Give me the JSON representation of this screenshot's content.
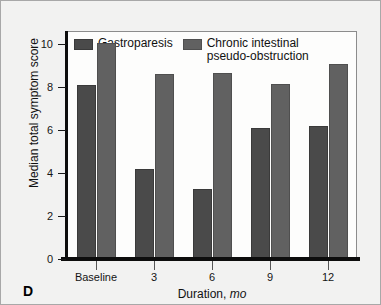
{
  "panel": {
    "label": "D"
  },
  "chart_data": {
    "type": "bar",
    "title": "",
    "xlabel": "Duration, mo",
    "xlabel_text": "Duration, ",
    "xlabel_unit": "mo",
    "ylabel": "Median total symptom score",
    "categories": [
      "Baseline",
      "3",
      "6",
      "9",
      "12"
    ],
    "yticks": [
      0,
      2,
      4,
      6,
      8,
      10
    ],
    "ylim": [
      0,
      10.6
    ],
    "grid": false,
    "legend_position": "top-left",
    "series": [
      {
        "name": "Gastroparesis",
        "color": "#4a4a4a",
        "values": [
          8.1,
          4.2,
          3.25,
          6.1,
          6.2
        ]
      },
      {
        "name": "Chronic intestinal pseudo-obstruction",
        "name_display": "Chronic intestinal\npseudo-obstruction",
        "color": "#616161",
        "values": [
          10.05,
          8.6,
          8.65,
          8.15,
          9.05
        ]
      }
    ]
  }
}
